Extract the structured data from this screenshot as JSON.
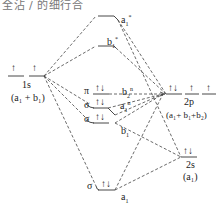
{
  "header_fragment": "全沾 / 的细行合",
  "diagram": {
    "type": "molecular-orbital-diagram",
    "left_group": {
      "orbital_label": "1s",
      "symmetry_label": "(a₁ + b₁)",
      "electrons": "↑ ↑"
    },
    "right_groups": [
      {
        "orbital_label": "2p",
        "symmetry_label": "(a₁+ b₁+b₂)",
        "electrons": [
          "↑↓",
          "↑",
          "↑"
        ]
      },
      {
        "orbital_label": "2s",
        "symmetry_label": "(a₁)",
        "electrons": "↑↓"
      }
    ],
    "molecular_orbitals": [
      {
        "name": "a₁*",
        "sym": "a",
        "sub": "1",
        "sup": "*",
        "occupancy": ""
      },
      {
        "name": "b₁*",
        "sym": "b",
        "sub": "1",
        "sup": "*",
        "occupancy": ""
      },
      {
        "name": "b₂ⁿ",
        "sym": "b",
        "sub": "2",
        "sup": "n",
        "type_label": "π",
        "occupancy": "↑↓"
      },
      {
        "name": "a₁ⁿ",
        "sym": "a",
        "sub": "1",
        "sup": "n",
        "type_label": "σ",
        "occupancy": "↑↓"
      },
      {
        "name": "b₁",
        "sym": "b",
        "sub": "1",
        "sup": "",
        "type_label": "σ",
        "occupancy": "↑↓"
      },
      {
        "name": "a₁",
        "sym": "a",
        "sub": "1",
        "sup": "",
        "type_label": "σ",
        "occupancy": "↑↓"
      }
    ],
    "labels": {
      "a1_star": "a",
      "b1_star": "b",
      "pi": "π",
      "sigma": "σ",
      "one_s": "1s",
      "one_s_sym": "(a₁ + b₁)",
      "two_p": "2p",
      "two_p_sym": "(a₁+ b₁+b₂)",
      "two_s": "2s",
      "two_s_sym": "(a₁)",
      "b2n": "b",
      "a1n": "a",
      "b1": "b",
      "a1": "a",
      "sub1": "1",
      "sub2": "2",
      "star": "*",
      "n": "n",
      "up": "↑",
      "pair": "↑↓"
    }
  }
}
